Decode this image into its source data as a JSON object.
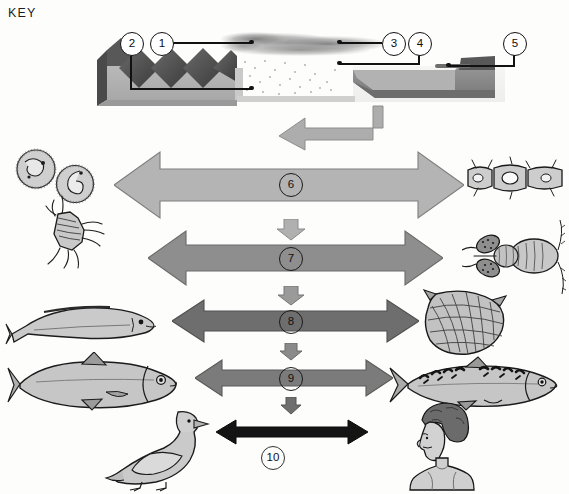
{
  "diagram": {
    "title": "KEY",
    "type": "marine-pollution-bioaccumulation-food-chain",
    "callouts": [
      {
        "id": "1",
        "number": "1",
        "name": "factory-chimney-emission",
        "cx": 161,
        "cy": 43
      },
      {
        "id": "2",
        "number": "2",
        "name": "factory-effluent-outfall",
        "cx": 131,
        "cy": 43
      },
      {
        "id": "3",
        "number": "3",
        "name": "airborne-pollutant-cloud",
        "cx": 393,
        "cy": 43
      },
      {
        "id": "4",
        "number": "4",
        "name": "pollutant-fallout-to-sea",
        "cx": 419,
        "cy": 43
      },
      {
        "id": "5",
        "number": "5",
        "name": "ship-waste-dumping",
        "cx": 514,
        "cy": 43
      }
    ],
    "bands": [
      {
        "number": "6",
        "name": "phytoplankton-zooplankton-level",
        "color": "#b4b4b4",
        "left": 114,
        "top": 150,
        "width": 350,
        "height": 70,
        "num_cx": 290,
        "num_cy": 184,
        "num_outside": false
      },
      {
        "number": "7",
        "name": "small-crustacean-level",
        "color": "#8e8e8e",
        "left": 148,
        "top": 229,
        "width": 295,
        "height": 58,
        "num_cx": 290,
        "num_cy": 258,
        "num_outside": false
      },
      {
        "number": "8",
        "name": "small-fish-shellfish-level",
        "color": "#6e6e6e",
        "left": 172,
        "top": 298,
        "width": 247,
        "height": 46,
        "num_cx": 290,
        "num_cy": 321,
        "num_outside": false
      },
      {
        "number": "9",
        "name": "predatory-fish-level",
        "color": "#7b7b7b",
        "left": 195,
        "top": 358,
        "width": 198,
        "height": 40,
        "num_cx": 290,
        "num_cy": 378,
        "num_outside": false
      },
      {
        "number": "10",
        "name": "top-predator-human-level",
        "color": "#141414",
        "left": 216,
        "top": 418,
        "width": 152,
        "height": 28,
        "num_cx": 272,
        "num_cy": 457,
        "num_outside": true
      }
    ],
    "connector_arrows": [
      {
        "name": "source-to-level6-elbow",
        "kind": "elbow",
        "color": "#a9a9a9"
      },
      {
        "name": "level6-to-level7-arrow",
        "kind": "down",
        "color": "#b0b0b0",
        "cx": 291,
        "top": 219,
        "w": 30,
        "h": 22
      },
      {
        "name": "level7-to-level8-arrow",
        "kind": "down",
        "color": "#9a9a9a",
        "cx": 291,
        "top": 286,
        "w": 28,
        "h": 20
      },
      {
        "name": "level8-to-level9-arrow",
        "kind": "down",
        "color": "#8a8a8a",
        "cx": 291,
        "top": 343,
        "w": 24,
        "h": 18
      },
      {
        "name": "level9-to-level10-arrow",
        "kind": "down",
        "color": "#6f6f6f",
        "cx": 291,
        "top": 397,
        "w": 22,
        "h": 18
      }
    ],
    "organisms": [
      {
        "name": "protozoan-cyst-upper",
        "label": "protozoan cyst",
        "side": "left",
        "x": 12,
        "y": 148,
        "w": 46,
        "h": 40
      },
      {
        "name": "protozoan-cyst-lower",
        "label": "protozoan cyst",
        "side": "left",
        "x": 52,
        "y": 163,
        "w": 44,
        "h": 40
      },
      {
        "name": "copepod-left",
        "label": "copepod",
        "side": "left",
        "x": 28,
        "y": 196,
        "w": 78,
        "h": 68
      },
      {
        "name": "diatom-chain",
        "label": "diatom chain",
        "side": "right",
        "x": 470,
        "y": 158,
        "w": 96,
        "h": 40
      },
      {
        "name": "copepod-with-eggsacs",
        "label": "copepod with egg sacs",
        "side": "right",
        "x": 468,
        "y": 222,
        "w": 98,
        "h": 72
      },
      {
        "name": "sand-eel",
        "label": "sand eel",
        "side": "left",
        "x": 8,
        "y": 300,
        "w": 152,
        "h": 48
      },
      {
        "name": "scallop-shellfish",
        "label": "scallop",
        "side": "right",
        "x": 420,
        "y": 288,
        "w": 90,
        "h": 70
      },
      {
        "name": "herring",
        "label": "herring",
        "side": "left",
        "x": 10,
        "y": 355,
        "w": 178,
        "h": 58
      },
      {
        "name": "mackerel",
        "label": "mackerel",
        "side": "right",
        "x": 392,
        "y": 358,
        "w": 172,
        "h": 52
      },
      {
        "name": "seagull",
        "label": "seagull",
        "side": "left",
        "x": 96,
        "y": 400,
        "w": 112,
        "h": 90
      },
      {
        "name": "human",
        "label": "human",
        "side": "right",
        "x": 400,
        "y": 402,
        "w": 84,
        "h": 90
      }
    ],
    "scene_parts": [
      {
        "name": "factory-building",
        "label": "factory with sawtooth roof"
      },
      {
        "name": "smoke-plume",
        "label": "smoke plume"
      },
      {
        "name": "rain-fallout",
        "label": "rain / fallout"
      },
      {
        "name": "sea-water-body",
        "label": "sea"
      },
      {
        "name": "dumping-ship",
        "label": "waste dumping ship"
      }
    ]
  }
}
